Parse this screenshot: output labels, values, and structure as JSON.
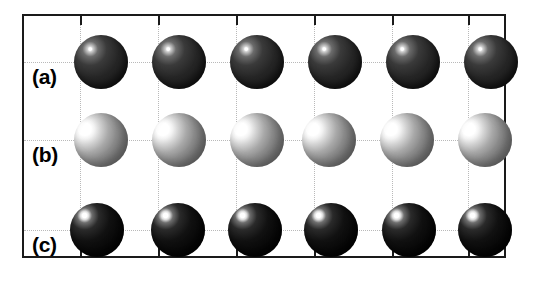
{
  "figure": {
    "type": "scientific-schematic",
    "background_color": "#ffffff",
    "frame": {
      "border_color": "#1a1a1a",
      "border_width_px": 2,
      "x": 22,
      "y": 14,
      "width": 484,
      "height": 244
    },
    "grid": {
      "line_style": "dotted",
      "line_color": "#b9b9b9",
      "vertical_lines_x": [
        78,
        156,
        234,
        312,
        390,
        448
      ],
      "horizontal_lines_y": [
        46,
        124,
        214
      ]
    },
    "ticks": {
      "top_x": [
        78,
        156,
        234,
        312,
        390,
        448
      ],
      "bottom_x": [
        78,
        156,
        234,
        312,
        390,
        448
      ],
      "right_y": [
        46,
        124,
        214
      ],
      "left_y": [
        46,
        124,
        214
      ]
    },
    "rows": [
      {
        "label": "(a)",
        "label_x": 26,
        "label_y": 60,
        "center_y": 60,
        "sphere_radius": 27,
        "shade": "dark-gray",
        "color": "#262626",
        "highlight_color": "#ffffff",
        "atom_class": "atom-a",
        "sphere_x": [
          99,
          177,
          255,
          333,
          411,
          489
        ]
      },
      {
        "label": "(b)",
        "label_x": 26,
        "label_y": 138,
        "center_y": 138,
        "sphere_radius": 27,
        "shade": "light-gray",
        "color": "#8c8c8c",
        "highlight_color": "#ffffff",
        "atom_class": "atom-b",
        "sphere_x": [
          99,
          177,
          255,
          327,
          405,
          483
        ]
      },
      {
        "label": "(c)",
        "label_x": 26,
        "label_y": 228,
        "center_y": 228,
        "sphere_radius": 27,
        "shade": "black",
        "color": "#0a0a0a",
        "highlight_color": "#ffffff",
        "atom_class": "atom-c",
        "sphere_x": [
          95,
          176,
          253,
          329,
          407,
          483
        ]
      }
    ]
  }
}
